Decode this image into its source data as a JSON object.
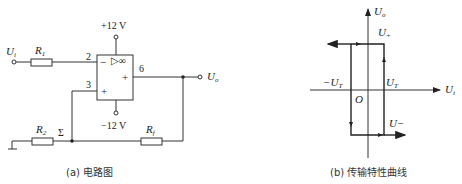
{
  "circuit": {
    "caption": "(a) 电路图",
    "input_label": "U",
    "input_sub": "i",
    "output_label": "U",
    "output_sub": "o",
    "r1_label": "R",
    "r1_sub": "1",
    "r2_label": "R",
    "r2_sub": "2",
    "rf_label": "R",
    "rf_sub": "f",
    "sigma_label": "Σ",
    "vplus_label": "+12 V",
    "vminus_label": "−12 V",
    "pin2": "2",
    "pin3": "3",
    "pin6": "6",
    "inv_sign": "−",
    "noninv_sign": "+",
    "out_sign": "+",
    "opamp_symbol": "▷∞"
  },
  "transfer": {
    "caption": "(b) 传输特性曲线",
    "y_axis_label": "U",
    "y_axis_sub": "o",
    "x_axis_label": "U",
    "x_axis_sub": "i",
    "u_plus_label": "U",
    "u_plus_sub": "+",
    "u_minus_label": "U−",
    "neg_threshold_label": "−U",
    "neg_threshold_sub": "T",
    "pos_threshold_label": "U",
    "pos_threshold_sub": "T",
    "origin_label": "O"
  }
}
